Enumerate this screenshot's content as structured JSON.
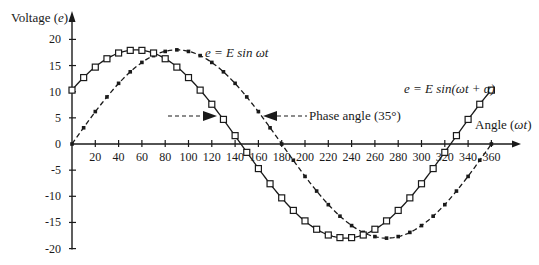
{
  "chart_data": {
    "type": "line",
    "title": "",
    "xlabel": "Angle (ωt)",
    "ylabel": "Voltage (e)",
    "xlim": [
      0,
      360
    ],
    "ylim": [
      -20,
      20
    ],
    "x_ticks": [
      20,
      40,
      60,
      80,
      100,
      120,
      140,
      160,
      180,
      200,
      220,
      240,
      260,
      280,
      300,
      320,
      340,
      360
    ],
    "y_ticks": [
      20,
      15,
      10,
      5,
      0,
      -5,
      -10,
      -15,
      -20
    ],
    "amplitude": 18,
    "sample_step_deg": 10,
    "series": [
      {
        "name": "e = E sin ωt",
        "marker": "filled-small-square",
        "line": "dash-dot",
        "phase_deg": 0,
        "x": [
          0,
          10,
          20,
          30,
          40,
          50,
          60,
          70,
          80,
          90,
          100,
          110,
          120,
          130,
          140,
          150,
          160,
          170,
          180,
          190,
          200,
          210,
          220,
          230,
          240,
          250,
          260,
          270,
          280,
          290,
          300,
          310,
          320,
          330,
          340,
          350,
          360
        ],
        "values": [
          0,
          3.1,
          6.2,
          9,
          11.6,
          13.8,
          15.6,
          16.9,
          17.7,
          18,
          17.7,
          16.9,
          15.6,
          13.8,
          11.6,
          9,
          6.2,
          3.1,
          0,
          -3.1,
          -6.2,
          -9,
          -11.6,
          -13.8,
          -15.6,
          -16.9,
          -17.7,
          -18,
          -17.7,
          -16.9,
          -15.6,
          -13.8,
          -11.6,
          -9,
          -6.2,
          -3.1,
          0
        ]
      },
      {
        "name": "e = E sin(ωt + α)",
        "marker": "open-square",
        "line": "solid",
        "phase_deg": 35,
        "x": [
          0,
          10,
          20,
          30,
          40,
          50,
          60,
          70,
          80,
          90,
          100,
          110,
          120,
          130,
          140,
          150,
          160,
          170,
          180,
          190,
          200,
          210,
          220,
          230,
          240,
          250,
          260,
          270,
          280,
          290,
          300,
          310,
          320,
          330,
          340,
          350,
          360
        ],
        "values": [
          10.3,
          12.7,
          14.7,
          16.3,
          17.4,
          17.9,
          17.9,
          17.4,
          16.3,
          14.7,
          12.7,
          10.3,
          7.6,
          4.7,
          1.6,
          -1.6,
          -4.7,
          -7.6,
          -10.3,
          -12.7,
          -14.7,
          -16.3,
          -17.4,
          -17.9,
          -17.9,
          -17.4,
          -16.3,
          -14.7,
          -12.7,
          -10.3,
          -7.6,
          -4.7,
          -1.6,
          1.6,
          4.7,
          7.6,
          10.3
        ]
      }
    ],
    "annotations": [
      {
        "text": "e = E sin ωt",
        "near_series": 0
      },
      {
        "text": "e = E sin(ωt + α)",
        "near_series": 1
      },
      {
        "text": "Phase angle (35°)",
        "type": "dimension-arrows",
        "from_deg": 145,
        "to_deg": 180
      }
    ],
    "grid": false,
    "legend": "none"
  },
  "labels": {
    "ylabel_main": "Voltage (",
    "ylabel_var": "e",
    "ylabel_close": ")",
    "xlabel_main": "Angle (",
    "xlabel_var": "ωt",
    "xlabel_close": ")",
    "series0_label": "e = E sin ωt",
    "series1_label": "e = E sin(ωt + α)",
    "phase_label": "Phase angle (35°)"
  },
  "colors": {
    "ink": "#1a1a1a",
    "background": "#ffffff"
  }
}
